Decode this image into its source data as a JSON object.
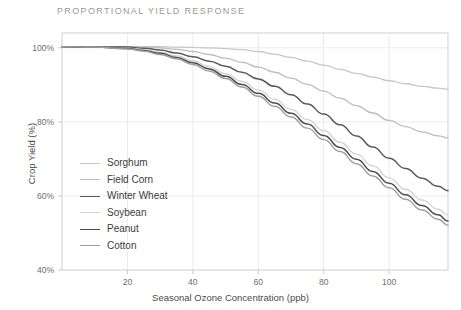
{
  "chart_data": {
    "type": "line",
    "title": "PROPORTIONAL YIELD RESPONSE",
    "xlabel": "Seasonal Ozone Concentration (ppb)",
    "ylabel": "Crop Yield (%)",
    "xlim": [
      0,
      118
    ],
    "ylim": [
      40,
      104
    ],
    "xticks": [
      20,
      40,
      60,
      80,
      100
    ],
    "xtick_labels": [
      "20",
      "40",
      "60",
      "80",
      "100"
    ],
    "yticks": [
      40,
      60,
      80,
      100
    ],
    "ytick_labels": [
      "40%",
      "60%",
      "80%",
      "100%"
    ],
    "grid": true,
    "legend_position": "inside-left",
    "x": [
      0,
      10,
      20,
      25,
      30,
      35,
      40,
      45,
      50,
      55,
      60,
      65,
      70,
      75,
      80,
      85,
      90,
      95,
      100,
      105,
      110,
      115,
      118
    ],
    "series": [
      {
        "name": "Sorghum",
        "color": "#c8c8c8",
        "width": 1.3,
        "values": [
          100.3,
          100.3,
          100.3,
          100.3,
          100.3,
          100.2,
          100.1,
          100.0,
          99.8,
          99.5,
          99.0,
          98.3,
          97.4,
          96.4,
          95.3,
          94.2,
          93.1,
          92.1,
          91.1,
          90.3,
          89.6,
          89.1,
          88.8
        ]
      },
      {
        "name": "Field Corn",
        "color": "#bdbdbd",
        "width": 1.3,
        "values": [
          100.3,
          100.3,
          100.3,
          100.2,
          100.0,
          99.6,
          99.0,
          98.2,
          97.2,
          96.1,
          94.8,
          93.4,
          91.8,
          90.1,
          88.3,
          86.4,
          84.4,
          82.4,
          80.4,
          78.7,
          77.3,
          76.2,
          75.7
        ]
      },
      {
        "name": "Winter Wheat",
        "color": "#5a5a5a",
        "width": 1.5,
        "values": [
          100.3,
          100.3,
          100.2,
          99.9,
          99.4,
          98.6,
          97.6,
          96.4,
          95.0,
          93.4,
          91.6,
          89.6,
          87.3,
          84.8,
          82.1,
          79.2,
          76.2,
          73.2,
          70.2,
          67.4,
          64.8,
          62.6,
          61.4
        ]
      },
      {
        "name": "Soybean",
        "color": "#d2d2d2",
        "width": 1.3,
        "values": [
          100.3,
          100.2,
          99.9,
          99.5,
          98.8,
          97.8,
          96.5,
          94.9,
          93.0,
          90.9,
          88.6,
          86.1,
          83.4,
          80.6,
          77.6,
          74.5,
          71.3,
          68.1,
          64.9,
          61.8,
          58.9,
          56.4,
          54.8
        ]
      },
      {
        "name": "Peanut",
        "color": "#4e4e4e",
        "width": 1.5,
        "values": [
          100.3,
          100.2,
          99.8,
          99.3,
          98.5,
          97.4,
          96.0,
          94.3,
          92.3,
          90.1,
          87.7,
          85.1,
          82.3,
          79.4,
          76.3,
          73.1,
          69.9,
          66.6,
          63.4,
          60.3,
          57.4,
          54.9,
          53.2
        ]
      },
      {
        "name": "Cotton",
        "color": "#9e9e9e",
        "width": 1.4,
        "values": [
          100.3,
          100.2,
          99.7,
          99.1,
          98.2,
          97.0,
          95.5,
          93.7,
          91.7,
          89.4,
          86.9,
          84.2,
          81.3,
          78.3,
          75.2,
          72.0,
          68.7,
          65.4,
          62.2,
          59.1,
          56.2,
          53.7,
          52.1
        ]
      }
    ]
  },
  "axes": {
    "border_color": "#cfcfcf",
    "grid_color": "#ebebeb",
    "tick_color": "#cccccc"
  }
}
